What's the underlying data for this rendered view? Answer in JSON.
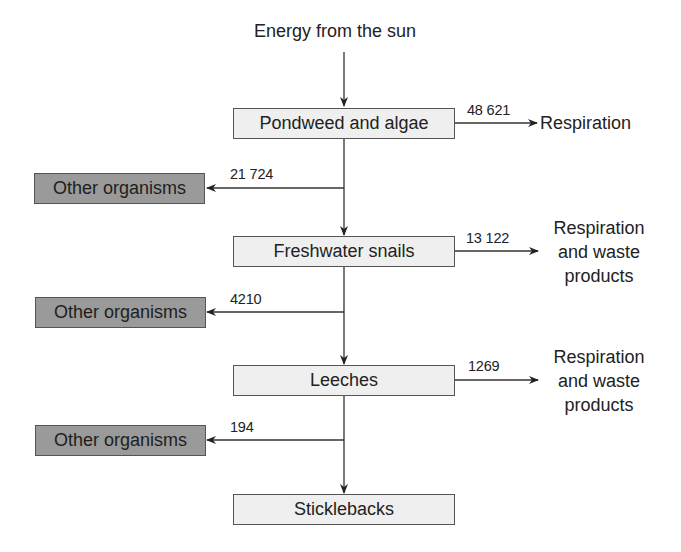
{
  "diagram": {
    "title": "Energy from the sun",
    "main_chain": [
      {
        "id": "pondweed",
        "label": "Pondweed and algae"
      },
      {
        "id": "snails",
        "label": "Freshwater snails"
      },
      {
        "id": "leeches",
        "label": "Leeches"
      },
      {
        "id": "sticklebacks",
        "label": "Sticklebacks"
      }
    ],
    "losses_right": [
      {
        "from": "Pondweed and algae",
        "value": "48 621",
        "label_lines": [
          "Respiration"
        ]
      },
      {
        "from": "Freshwater snails",
        "value": "13 122",
        "label_lines": [
          "Respiration",
          "and waste",
          "products"
        ]
      },
      {
        "from": "Leeches",
        "value": "1269",
        "label_lines": [
          "Respiration",
          "and waste",
          "products"
        ]
      }
    ],
    "losses_left": [
      {
        "from": "Pondweed and algae",
        "value": "21 724",
        "label": "Other organisms"
      },
      {
        "from": "Freshwater snails",
        "value": "4210",
        "label": "Other organisms"
      },
      {
        "from": "Leeches",
        "value": "194",
        "label": "Other organisms"
      }
    ],
    "colors": {
      "box_light": "#efefef",
      "box_dark": "#9a9a9a",
      "line": "#333333"
    }
  }
}
